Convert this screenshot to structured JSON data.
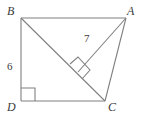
{
  "figure": {
    "shape_type": "quadrilateral",
    "stroke_color": "#808080",
    "label_color": "#3b3b3b",
    "background_color": "#ffffff",
    "vertices": [
      {
        "name": "B",
        "label": "B",
        "x": 21,
        "y": 18,
        "label_x": 7,
        "label_y": 5
      },
      {
        "name": "A",
        "label": "A",
        "x": 126,
        "y": 18,
        "label_x": 127,
        "label_y": 5
      },
      {
        "name": "C",
        "label": "C",
        "x": 105,
        "y": 101,
        "label_x": 108,
        "label_y": 101
      },
      {
        "name": "D",
        "label": "D",
        "x": 21,
        "y": 101,
        "label_x": 7,
        "label_y": 101
      }
    ],
    "foot_of_altitude": {
      "name": "E",
      "x": 78,
      "y": 72
    },
    "segments": [
      {
        "name": "side-BA",
        "from": "B",
        "to": "A"
      },
      {
        "name": "side-BD",
        "from": "B",
        "to": "D"
      },
      {
        "name": "side-DC",
        "from": "D",
        "to": "C"
      },
      {
        "name": "side-AC",
        "from": "A",
        "to": "C"
      },
      {
        "name": "diagonal-BC",
        "from": "B",
        "to": "C"
      },
      {
        "name": "altitude-AE",
        "from": "A",
        "to": "E"
      }
    ],
    "right_angle_marks": [
      {
        "name": "right-angle-at-D",
        "at": "D",
        "size": 14
      },
      {
        "name": "right-angle-at-E",
        "at": "E",
        "size": 11
      }
    ],
    "measures": [
      {
        "name": "length-BD",
        "value": "6",
        "on_segment": "side-BD",
        "label_x": 7,
        "label_y": 61
      },
      {
        "name": "length-AE",
        "value": "7",
        "on_segment": "altitude-AE",
        "label_x": 84,
        "label_y": 33
      }
    ]
  }
}
